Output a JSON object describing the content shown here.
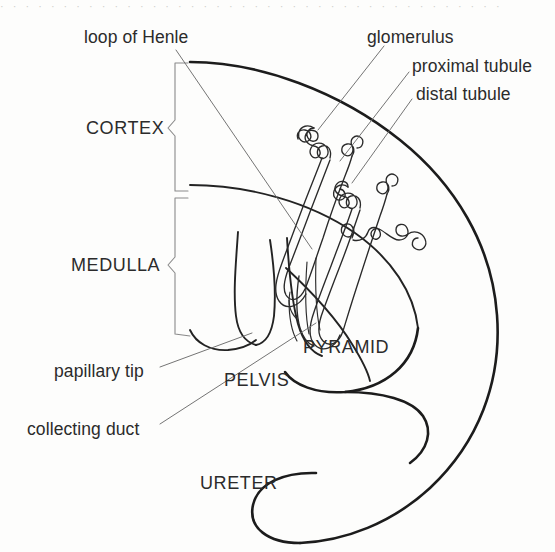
{
  "figure": {
    "background_color": "#fdfdfc",
    "ink_color": "#1c1c1c",
    "leader_color": "#6d6d6d",
    "scan_artifact_text": "· · · · · · · · · · · · · · · · · · · · · · · · · · · · · · · · · · · · · · · ·"
  },
  "labels": {
    "loop_of_henle": "loop of Henle",
    "glomerulus": "glomerulus",
    "proximal_tubule": "proximal tubule",
    "distal_tubule": "distal tubule",
    "cortex": "CORTEX",
    "medulla": "MEDULLA",
    "papillary_tip": "papillary tip",
    "pelvis": "PELVIS",
    "pyramid": "PYRAMID",
    "collecting_duct": "collecting duct",
    "ureter": "URETER"
  },
  "regions": [
    {
      "name": "cortex",
      "label": "CORTEX",
      "style": "uppercase",
      "bracket": true
    },
    {
      "name": "medulla",
      "label": "MEDULLA",
      "style": "uppercase",
      "bracket": true
    },
    {
      "name": "pyramid",
      "label": "PYRAMID",
      "style": "uppercase",
      "bracket": false
    },
    {
      "name": "pelvis",
      "label": "PELVIS",
      "style": "uppercase",
      "bracket": false
    },
    {
      "name": "ureter",
      "label": "URETER",
      "style": "uppercase",
      "bracket": false
    }
  ],
  "callouts": [
    {
      "name": "loop-of-henle",
      "label": "loop of Henle",
      "leader": true
    },
    {
      "name": "glomerulus",
      "label": "glomerulus",
      "leader": true
    },
    {
      "name": "proximal-tubule",
      "label": "proximal tubule",
      "leader": true
    },
    {
      "name": "distal-tubule",
      "label": "distal tubule",
      "leader": true
    },
    {
      "name": "papillary-tip",
      "label": "papillary tip",
      "leader": true
    },
    {
      "name": "collecting-duct",
      "label": "collecting duct",
      "leader": true
    }
  ]
}
